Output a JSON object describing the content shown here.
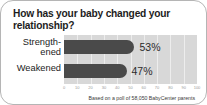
{
  "chart_data": {
    "type": "bar",
    "orientation": "horizontal",
    "title": "How has your baby changed your relationship?",
    "categories": [
      "Strength-­ened",
      "Weakened"
    ],
    "category_labels": [
      {
        "line1": "Strength-",
        "line2": "ened"
      },
      {
        "line1": "Weakened",
        "line2": ""
      }
    ],
    "values": [
      53,
      47
    ],
    "value_labels": [
      "53%",
      "47%"
    ],
    "xlabel": "",
    "ylabel": "",
    "xlim": [
      0,
      100
    ],
    "xticks": [
      0,
      10,
      20,
      30,
      40,
      50,
      60,
      70,
      80,
      90,
      100
    ],
    "xtick_labels": [
      "0",
      "10",
      "20",
      "30",
      "40",
      "50",
      "60",
      "70",
      "80",
      "90",
      "100"
    ],
    "grid": true,
    "legend": false,
    "caption": "Based on a poll of 58,050 BabyCenter parents",
    "colors": {
      "bar": "#4a4a4a",
      "plot_background": "#d8d8d8",
      "gridline": "#ffffff",
      "title_text": "#1d1d1d",
      "value_text": "#2b2b2b",
      "tick_text": "#9a9a9a",
      "card_border": "#b5b5b5",
      "card_background": "#ffffff"
    }
  }
}
